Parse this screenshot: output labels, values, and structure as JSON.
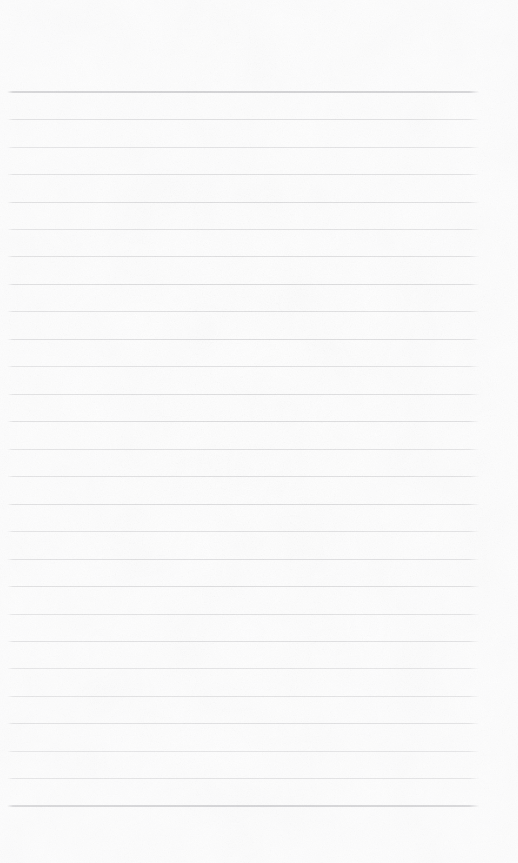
{
  "document": {
    "kind": "scanned-lined-notebook-page",
    "page_width": 518,
    "page_height": 863,
    "paper_color": "#fefefe",
    "has_text_content": false,
    "written_content": "",
    "notes_written": ""
  },
  "ruling": {
    "line_color": "#a9a9ad",
    "header_line_color": "#8e8e94",
    "line_count": 27,
    "line_spacing_px": 27.4,
    "line_left_x": 7,
    "line_right_x": 479,
    "line_thickness_px": 1,
    "header_line_thickness_px": 2,
    "first_line_y": 92,
    "top_margin_px": 92,
    "bottom_margin_px": 58,
    "right_margin_px": 39,
    "left_margin_px": 7
  },
  "lines": [
    {
      "index": 1,
      "y": 92,
      "emphasis": "header",
      "text": ""
    },
    {
      "index": 2,
      "y": 119.6,
      "emphasis": "normal",
      "text": ""
    },
    {
      "index": 3,
      "y": 147.0,
      "emphasis": "normal",
      "text": ""
    },
    {
      "index": 4,
      "y": 174.5,
      "emphasis": "normal",
      "text": ""
    },
    {
      "index": 5,
      "y": 202.0,
      "emphasis": "normal",
      "text": ""
    },
    {
      "index": 6,
      "y": 229.4,
      "emphasis": "normal",
      "text": ""
    },
    {
      "index": 7,
      "y": 256.9,
      "emphasis": "normal",
      "text": ""
    },
    {
      "index": 8,
      "y": 284.4,
      "emphasis": "normal",
      "text": ""
    },
    {
      "index": 9,
      "y": 311.8,
      "emphasis": "normal",
      "text": ""
    },
    {
      "index": 10,
      "y": 339.3,
      "emphasis": "normal",
      "text": ""
    },
    {
      "index": 11,
      "y": 366.8,
      "emphasis": "normal",
      "text": ""
    },
    {
      "index": 12,
      "y": 394.2,
      "emphasis": "normal",
      "text": ""
    },
    {
      "index": 13,
      "y": 421.7,
      "emphasis": "normal",
      "text": ""
    },
    {
      "index": 14,
      "y": 449.2,
      "emphasis": "normal",
      "text": ""
    },
    {
      "index": 15,
      "y": 476.6,
      "emphasis": "normal",
      "text": ""
    },
    {
      "index": 16,
      "y": 504.1,
      "emphasis": "normal",
      "text": ""
    },
    {
      "index": 17,
      "y": 531.6,
      "emphasis": "normal",
      "text": ""
    },
    {
      "index": 18,
      "y": 559.0,
      "emphasis": "normal",
      "text": ""
    },
    {
      "index": 19,
      "y": 586.5,
      "emphasis": "normal",
      "text": ""
    },
    {
      "index": 20,
      "y": 614.0,
      "emphasis": "normal",
      "text": ""
    },
    {
      "index": 21,
      "y": 641.4,
      "emphasis": "normal",
      "text": ""
    },
    {
      "index": 22,
      "y": 668.9,
      "emphasis": "normal",
      "text": ""
    },
    {
      "index": 23,
      "y": 696.4,
      "emphasis": "normal",
      "text": ""
    },
    {
      "index": 24,
      "y": 723.8,
      "emphasis": "normal",
      "text": ""
    },
    {
      "index": 25,
      "y": 751.3,
      "emphasis": "normal",
      "text": ""
    },
    {
      "index": 26,
      "y": 778.8,
      "emphasis": "normal",
      "text": ""
    },
    {
      "index": 27,
      "y": 806.2,
      "emphasis": "header",
      "text": ""
    }
  ]
}
